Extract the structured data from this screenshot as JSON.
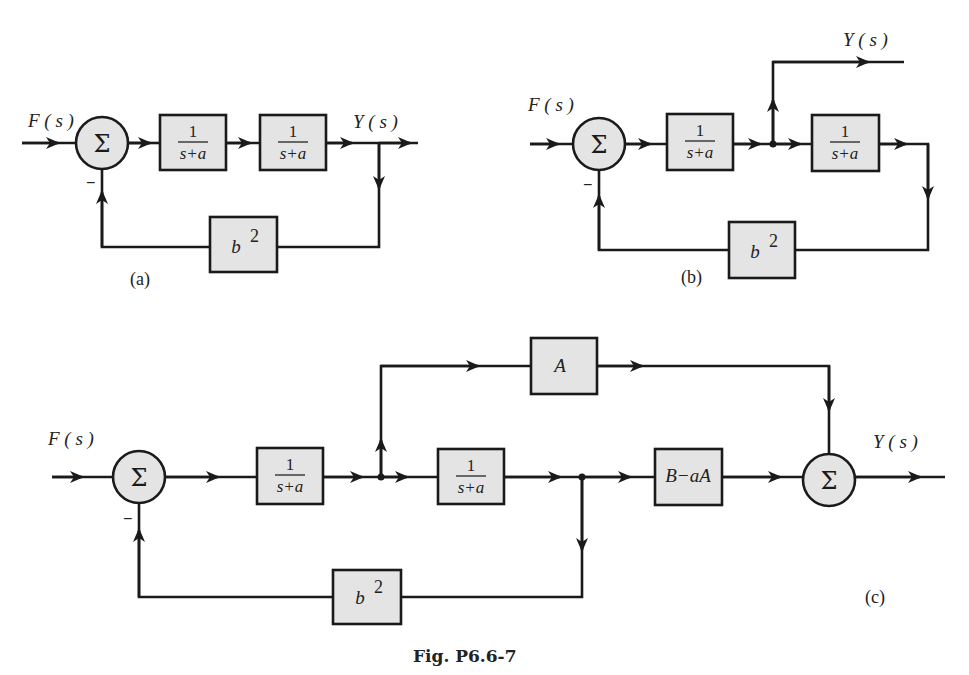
{
  "figure": {
    "caption": "Fig. P6.6-7"
  },
  "diagram_a": {
    "label": "(a)",
    "input_label": "F ( s )",
    "output_label": "Y ( s )",
    "sum_symbol": "Σ",
    "feedback_sign": "−",
    "blocks": [
      {
        "num": "1",
        "den": "s+a"
      },
      {
        "num": "1",
        "den": "s+a"
      }
    ],
    "feedback_block": {
      "base": "b",
      "sup": "2"
    }
  },
  "diagram_b": {
    "label": "(b)",
    "input_label": "F ( s )",
    "output_label": "Y ( s )",
    "sum_symbol": "Σ",
    "feedback_sign": "−",
    "blocks": [
      {
        "num": "1",
        "den": "s+a"
      },
      {
        "num": "1",
        "den": "s+a"
      }
    ],
    "feedback_block": {
      "base": "b",
      "sup": "2"
    }
  },
  "diagram_c": {
    "label": "(c)",
    "input_label": "F ( s )",
    "output_label": "Y ( s )",
    "sum_symbol": "Σ",
    "feedback_sign": "−",
    "blocks": [
      {
        "num": "1",
        "den": "s+a"
      },
      {
        "num": "1",
        "den": "s+a"
      }
    ],
    "feedforward_block": "A",
    "output_block": "B−aA",
    "feedback_block": {
      "base": "b",
      "sup": "2"
    }
  }
}
